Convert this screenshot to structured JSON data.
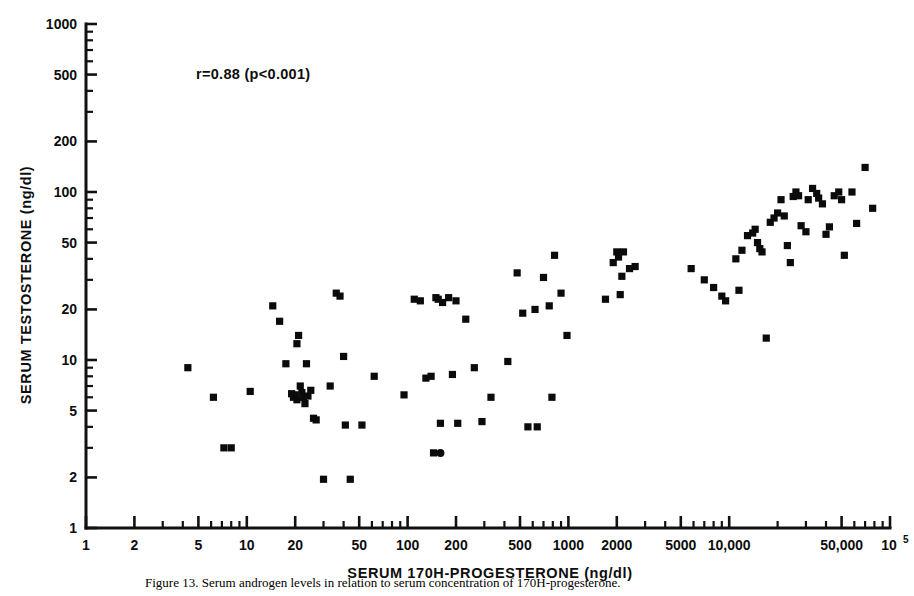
{
  "figure": {
    "annotation": "r=0.88  (p<0.001)",
    "caption": "Figure 13.  Serum androgen levels in relation to serum concentration of 170H-progesterone."
  },
  "chart_data": {
    "type": "scatter",
    "title": "",
    "xlabel": "SERUM 170H-PROGESTERONE (ng/dl)",
    "ylabel": "SERUM TESTOSTERONE (ng/dl)",
    "xscale": "log",
    "yscale": "log",
    "xlim": [
      1,
      100000
    ],
    "ylim": [
      1,
      1000
    ],
    "grid": false,
    "legend": null,
    "annotations": [
      "r=0.88  (p<0.001)"
    ],
    "correlation_r": 0.88,
    "p_value": "<0.001",
    "xticks": [
      1,
      2,
      5,
      10,
      20,
      50,
      100,
      200,
      500,
      1000,
      2000,
      5000,
      10000,
      50000,
      100000
    ],
    "xticklabels": [
      "1",
      "2",
      "5",
      "10",
      "20",
      "50",
      "100",
      "200",
      "500",
      "1000",
      "2000",
      "5000",
      "10,000",
      "50,000",
      "10⁵"
    ],
    "yticks": [
      1,
      2,
      5,
      10,
      20,
      50,
      100,
      200,
      500,
      1000
    ],
    "yticklabels": [
      "1",
      "2",
      "5",
      "10",
      "20",
      "50",
      "100",
      "200",
      "500",
      "1000"
    ],
    "marker": "square",
    "series": [
      {
        "name": "patients",
        "marker": "square",
        "color": "#0b0b0b",
        "points": [
          [
            4.3,
            9.0
          ],
          [
            6.2,
            6.0
          ],
          [
            7.2,
            3.0
          ],
          [
            8.0,
            3.0
          ],
          [
            10.5,
            6.5
          ],
          [
            14.5,
            21.0
          ],
          [
            16.0,
            17.0
          ],
          [
            17.5,
            9.5
          ],
          [
            19.0,
            6.3
          ],
          [
            19.5,
            6.0
          ],
          [
            20.0,
            6.2
          ],
          [
            20.5,
            5.8
          ],
          [
            20.5,
            12.5
          ],
          [
            21.0,
            14.0
          ],
          [
            21.5,
            7.0
          ],
          [
            22.0,
            6.4
          ],
          [
            22.5,
            6.0
          ],
          [
            23.0,
            5.5
          ],
          [
            23.5,
            9.5
          ],
          [
            24.0,
            6.1
          ],
          [
            25.0,
            6.6
          ],
          [
            26.0,
            4.5
          ],
          [
            27.0,
            4.4
          ],
          [
            30.0,
            1.95
          ],
          [
            33.0,
            7.0
          ],
          [
            36.0,
            25.0
          ],
          [
            38.0,
            24.0
          ],
          [
            40.0,
            10.5
          ],
          [
            41.0,
            4.1
          ],
          [
            44.0,
            1.95
          ],
          [
            52.0,
            4.1
          ],
          [
            62.0,
            8.0
          ],
          [
            95.0,
            6.2
          ],
          [
            110.0,
            23.0
          ],
          [
            120.0,
            22.5
          ],
          [
            130.0,
            7.8
          ],
          [
            140.0,
            8.0
          ],
          [
            145.0,
            2.8
          ],
          [
            150.0,
            23.5
          ],
          [
            155.0,
            23.0
          ],
          [
            160.0,
            4.2
          ],
          [
            165.0,
            22.0
          ],
          [
            180.0,
            23.5
          ],
          [
            190.0,
            8.2
          ],
          [
            200.0,
            22.5
          ],
          [
            205.0,
            4.2
          ],
          [
            230.0,
            17.5
          ],
          [
            260.0,
            9.0
          ],
          [
            290.0,
            4.3
          ],
          [
            330.0,
            6.0
          ],
          [
            420.0,
            9.8
          ],
          [
            480.0,
            33.0
          ],
          [
            520.0,
            19.0
          ],
          [
            560.0,
            4.0
          ],
          [
            620.0,
            20.0
          ],
          [
            640.0,
            4.0
          ],
          [
            700.0,
            31.0
          ],
          [
            760.0,
            21.0
          ],
          [
            790.0,
            6.0
          ],
          [
            820.0,
            42.0
          ],
          [
            900.0,
            25.0
          ],
          [
            980.0,
            14.0
          ],
          [
            1700.0,
            23.0
          ],
          [
            1900.0,
            38.0
          ],
          [
            2000.0,
            44.0
          ],
          [
            2050.0,
            41.0
          ],
          [
            2100.0,
            24.5
          ],
          [
            2150.0,
            31.5
          ],
          [
            2200.0,
            44.0
          ],
          [
            2400.0,
            35.0
          ],
          [
            2600.0,
            36.0
          ],
          [
            5800.0,
            35.0
          ],
          [
            7000.0,
            30.0
          ],
          [
            8000.0,
            27.0
          ],
          [
            9000.0,
            24.0
          ],
          [
            9500.0,
            22.5
          ],
          [
            11000.0,
            40.0
          ],
          [
            11500.0,
            26.0
          ],
          [
            12000.0,
            45.0
          ],
          [
            13000.0,
            55.0
          ],
          [
            14000.0,
            57.0
          ],
          [
            14500.0,
            60.0
          ],
          [
            15000.0,
            50.0
          ],
          [
            15500.0,
            46.0
          ],
          [
            16000.0,
            44.0
          ],
          [
            17000.0,
            13.5
          ],
          [
            18000.0,
            66.0
          ],
          [
            19000.0,
            70.0
          ],
          [
            20000.0,
            75.0
          ],
          [
            21000.0,
            90.0
          ],
          [
            22000.0,
            72.0
          ],
          [
            23000.0,
            48.0
          ],
          [
            24000.0,
            38.0
          ],
          [
            25000.0,
            94.0
          ],
          [
            26000.0,
            100.0
          ],
          [
            27000.0,
            95.0
          ],
          [
            28000.0,
            63.0
          ],
          [
            30000.0,
            58.0
          ],
          [
            31000.0,
            90.0
          ],
          [
            33000.0,
            105.0
          ],
          [
            35000.0,
            98.0
          ],
          [
            36000.0,
            92.0
          ],
          [
            38000.0,
            85.0
          ],
          [
            40000.0,
            56.0
          ],
          [
            42000.0,
            62.0
          ],
          [
            45000.0,
            95.0
          ],
          [
            48000.0,
            100.0
          ],
          [
            50000.0,
            90.0
          ],
          [
            52000.0,
            42.0
          ],
          [
            58000.0,
            100.0
          ],
          [
            62000.0,
            65.0
          ],
          [
            70000.0,
            140.0
          ],
          [
            78000.0,
            80.0
          ]
        ]
      },
      {
        "name": "outlier-circle",
        "marker": "circle",
        "color": "#0b0b0b",
        "points": [
          [
            160.0,
            2.8
          ]
        ]
      }
    ]
  }
}
